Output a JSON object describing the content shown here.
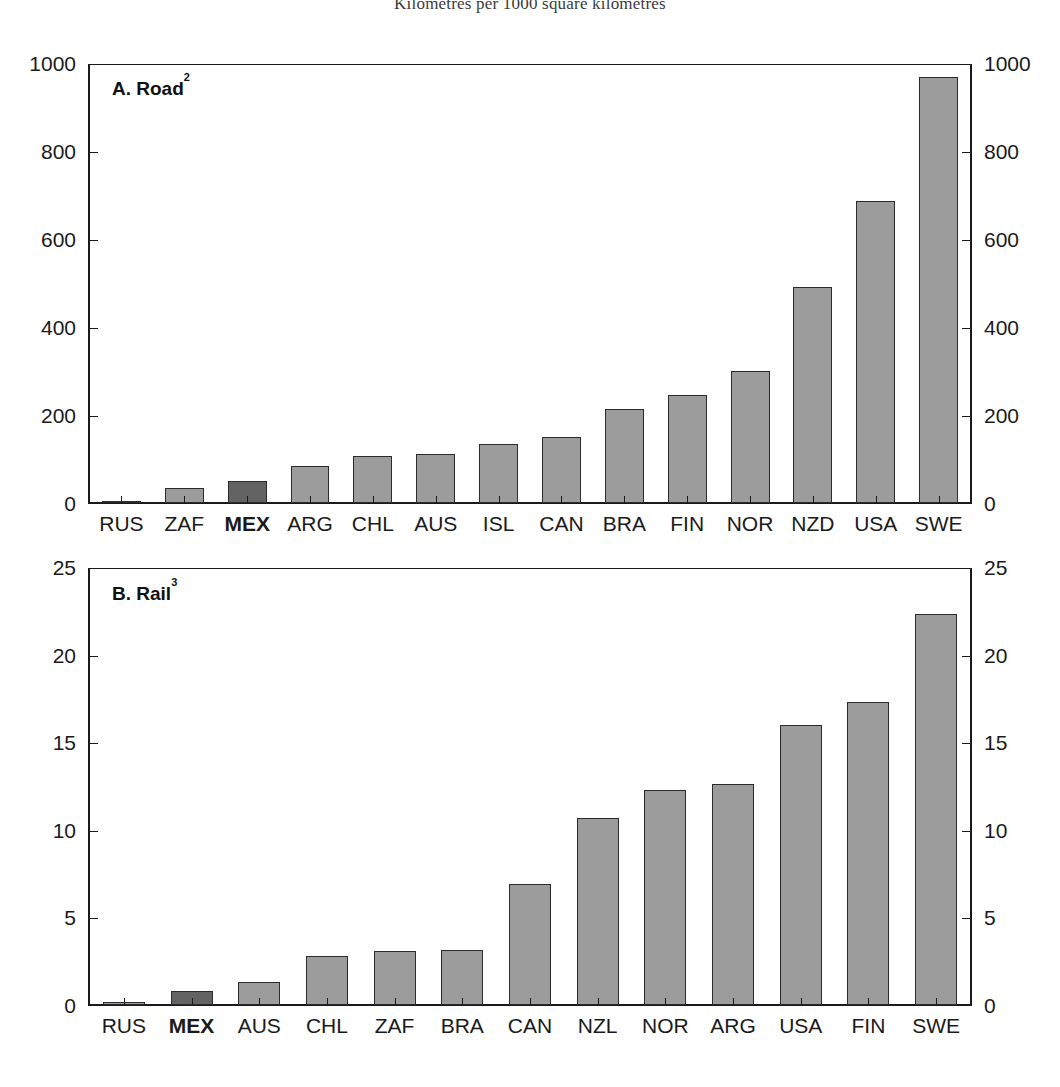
{
  "figure": {
    "title": "Kilometres per 1000 square kilometres"
  },
  "panels": [
    {
      "label": "A. Road",
      "footnote": "2",
      "y_ticks": [
        "0",
        "200",
        "400",
        "600",
        "800",
        "1000"
      ]
    },
    {
      "label": "B. Rail",
      "footnote": "3",
      "y_ticks": [
        "0",
        "5",
        "10",
        "15",
        "20",
        "25"
      ]
    }
  ],
  "chart_data": [
    {
      "type": "bar",
      "title": "A. Road 2",
      "subtitle": "Kilometres per 1000 square kilometres",
      "xlabel": "",
      "ylabel": "",
      "ylim": [
        0,
        1000
      ],
      "yticks": [
        0,
        200,
        400,
        600,
        800,
        1000
      ],
      "grid": false,
      "legend": "none",
      "highlight_category": "MEX",
      "colors": {
        "bar": "#9c9c9c",
        "bar_highlight": "#636363",
        "outline": "#2b2b2b"
      },
      "categories": [
        "RUS",
        "ZAF",
        "MEX",
        "ARG",
        "CHL",
        "AUS",
        "ISL",
        "CAN",
        "BRA",
        "FIN",
        "NOR",
        "NZD",
        "USA",
        "SWE"
      ],
      "values": [
        5,
        33,
        51,
        85,
        107,
        112,
        134,
        150,
        214,
        246,
        301,
        490,
        686,
        968
      ]
    },
    {
      "type": "bar",
      "title": "B. Rail 3",
      "subtitle": "Kilometres per 1000 square kilometres",
      "xlabel": "",
      "ylabel": "",
      "ylim": [
        0,
        25
      ],
      "yticks": [
        0,
        5,
        10,
        15,
        20,
        25
      ],
      "grid": false,
      "legend": "none",
      "highlight_category": "MEX",
      "colors": {
        "bar": "#9c9c9c",
        "bar_highlight": "#636363",
        "outline": "#2b2b2b"
      },
      "categories": [
        "RUS",
        "MEX",
        "AUS",
        "CHL",
        "ZAF",
        "BRA",
        "CAN",
        "NZL",
        "NOR",
        "ARG",
        "USA",
        "FIN",
        "SWE"
      ],
      "values": [
        0.2,
        0.8,
        1.3,
        2.8,
        3.1,
        3.15,
        6.9,
        10.7,
        12.3,
        12.6,
        16.0,
        17.3,
        22.3
      ]
    }
  ]
}
